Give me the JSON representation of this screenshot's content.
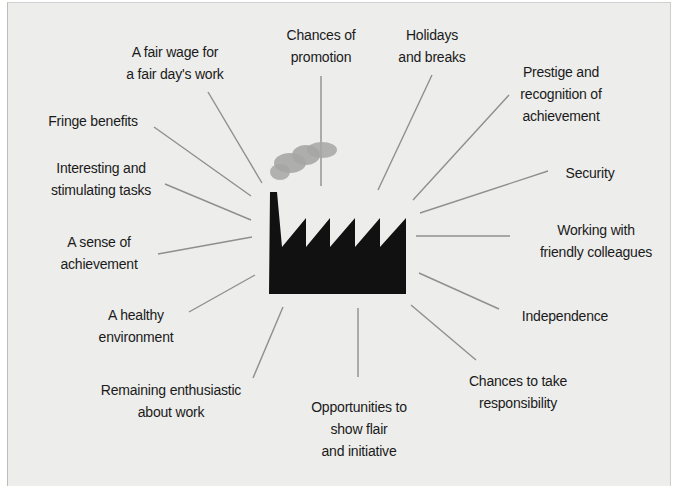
{
  "diagram": {
    "center": {
      "icon": "factory-icon",
      "smoke": "cloud-icon"
    },
    "colors": {
      "background": "#ededeb",
      "line": "#8f8f8f",
      "factory": "#111111",
      "smoke": "#a6a6a6",
      "text": "#1a1a1a"
    },
    "labels": [
      {
        "id": "fair-wage",
        "lines": [
          "A fair wage for",
          "a fair day's work"
        ],
        "x": 175,
        "y": 41
      },
      {
        "id": "promotion",
        "lines": [
          "Chances of",
          "promotion"
        ],
        "x": 321,
        "y": 24
      },
      {
        "id": "holidays",
        "lines": [
          "Holidays",
          "and breaks"
        ],
        "x": 432,
        "y": 24
      },
      {
        "id": "prestige",
        "lines": [
          "Prestige and",
          "recognition of",
          "achievement"
        ],
        "x": 561,
        "y": 61
      },
      {
        "id": "fringe",
        "lines": [
          "Fringe benefits"
        ],
        "x": 93,
        "y": 110
      },
      {
        "id": "security",
        "lines": [
          "Security"
        ],
        "x": 590,
        "y": 162
      },
      {
        "id": "interesting",
        "lines": [
          "Interesting and",
          "stimulating tasks"
        ],
        "x": 101,
        "y": 157
      },
      {
        "id": "friendly",
        "lines": [
          "Working with",
          "friendly colleagues"
        ],
        "x": 596,
        "y": 219
      },
      {
        "id": "sense-achievement",
        "lines": [
          "A sense of",
          "achievement"
        ],
        "x": 99,
        "y": 231
      },
      {
        "id": "healthy",
        "lines": [
          "A healthy",
          "environment"
        ],
        "x": 136,
        "y": 304
      },
      {
        "id": "independence",
        "lines": [
          "Independence"
        ],
        "x": 565,
        "y": 305
      },
      {
        "id": "enthusiastic",
        "lines": [
          "Remaining enthusiastic",
          "about work"
        ],
        "x": 171,
        "y": 379
      },
      {
        "id": "responsibility",
        "lines": [
          "Chances to take",
          "responsibility"
        ],
        "x": 518,
        "y": 370
      },
      {
        "id": "opportunities",
        "lines": [
          "Opportunities to",
          "show flair",
          "and initiative"
        ],
        "x": 359,
        "y": 396
      }
    ],
    "spokes": [
      [
        208,
        92,
        262,
        183
      ],
      [
        154,
        127,
        251,
        196
      ],
      [
        165,
        184,
        251,
        220
      ],
      [
        158,
        254,
        252,
        237
      ],
      [
        189,
        312,
        255,
        275
      ],
      [
        253,
        378,
        283,
        307
      ],
      [
        321,
        76,
        321,
        186
      ],
      [
        432,
        75,
        378,
        190
      ],
      [
        509,
        95,
        413,
        200
      ],
      [
        548,
        171,
        420,
        213
      ],
      [
        510,
        236,
        416,
        236
      ],
      [
        499,
        309,
        419,
        273
      ],
      [
        476,
        360,
        411,
        305
      ],
      [
        358,
        308,
        358,
        377
      ]
    ]
  }
}
